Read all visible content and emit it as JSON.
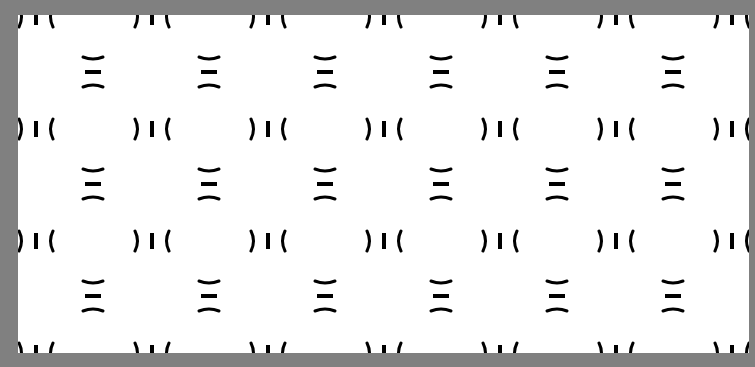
{
  "pattern": {
    "background_color": "#808080",
    "canvas_color": "#ffffff",
    "ink_color": "#000000",
    "canvas": {
      "x": 18,
      "y": 15,
      "width": 731,
      "height": 338
    },
    "column_spacing": 116,
    "row_spacing": 112,
    "horizontal_motif": {
      "description": "paren-bar-paren ') I ('",
      "first_center_x": 36,
      "center_ys": [
        17,
        129,
        241,
        353
      ],
      "columns": 7
    },
    "vertical_motif": {
      "description": "stacked arc-bar-arc",
      "first_center_x": 93,
      "center_ys": [
        72,
        184,
        296
      ],
      "columns": 6
    }
  }
}
